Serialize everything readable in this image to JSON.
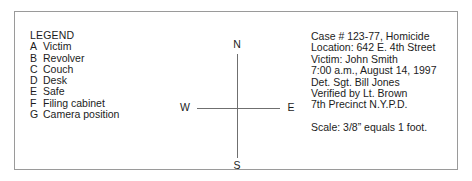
{
  "document": {
    "type": "crime-scene-sketch-legend-panel",
    "background_color": "#ffffff",
    "border_color": "#9a9a9a",
    "text_color": "#1c1c1c"
  },
  "legend": {
    "title": "LEGEND",
    "items": [
      {
        "key": "A",
        "label": "Victim"
      },
      {
        "key": "B",
        "label": "Revolver"
      },
      {
        "key": "C",
        "label": "Couch"
      },
      {
        "key": "D",
        "label": "Desk"
      },
      {
        "key": "E",
        "label": "Safe"
      },
      {
        "key": "F",
        "label": "Filing cabinet"
      },
      {
        "key": "G",
        "label": "Camera position"
      }
    ]
  },
  "compass": {
    "line_color": "#6f6f6f",
    "north": "N",
    "south": "S",
    "east": "E",
    "west": "W"
  },
  "case_info": {
    "lines": [
      "Case # 123-77, Homicide",
      "Location:  642 E. 4th Street",
      "Victim:  John Smith",
      "7:00 a.m., August 14, 1997",
      "Det. Sgt. Bill Jones",
      "Verified by Lt. Brown",
      "7th Precinct N.Y.P.D."
    ],
    "scale": "Scale: 3/8” equals 1 foot."
  }
}
